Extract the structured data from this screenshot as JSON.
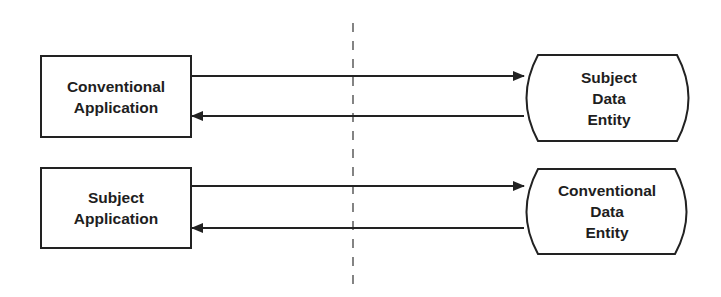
{
  "diagram": {
    "type": "data-access-diagram",
    "divider": {
      "style": "dashed"
    },
    "rows": [
      {
        "application": {
          "lines": [
            "Conventional",
            "Application"
          ]
        },
        "entity": {
          "lines": [
            "Subject",
            "Data",
            "Entity"
          ]
        },
        "arrows": [
          "application-to-entity",
          "entity-to-application"
        ]
      },
      {
        "application": {
          "lines": [
            "Subject",
            "Application"
          ]
        },
        "entity": {
          "lines": [
            "Conventional",
            "Data",
            "Entity"
          ]
        },
        "arrows": [
          "application-to-entity",
          "entity-to-application"
        ]
      }
    ]
  },
  "colors": {
    "stroke": "#222222",
    "background": "#ffffff",
    "text": "#1e1e1e"
  }
}
